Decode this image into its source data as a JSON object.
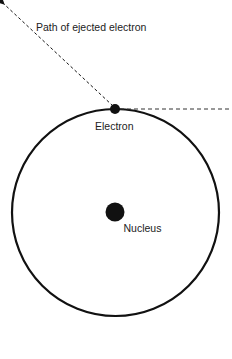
{
  "diagram": {
    "labels": {
      "path": "Path of ejected electron",
      "electron": "Electron",
      "nucleus": "Nucleus"
    },
    "colors": {
      "stroke": "#111111",
      "text": "#222222",
      "background": "#ffffff"
    }
  }
}
